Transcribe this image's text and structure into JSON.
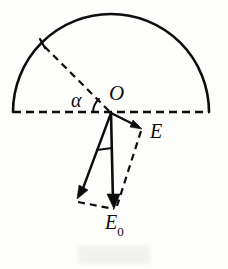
{
  "figure": {
    "kind": "vector-decomposition-diagram",
    "width": 228,
    "height": 269,
    "background_color": "#fdfdfc",
    "ink_color": "#0d0d0d"
  },
  "labels": {
    "origin": "O",
    "angle": "α",
    "field_resultant": "E",
    "field_base": "E",
    "field_base_subscript": "0"
  },
  "geometry": {
    "semicircle": {
      "center_x": 111,
      "center_y": 112,
      "radius": 98,
      "style": "solid",
      "span_degrees": 180
    },
    "diameter": {
      "from_x": 13,
      "from_y": 112,
      "to_x": 209,
      "to_y": 112,
      "style": "dashed"
    },
    "radius_line": {
      "from_x": 111,
      "from_y": 112,
      "to_x": 42,
      "to_y": 44,
      "style": "dashed"
    },
    "vector_E": {
      "from_x": 111,
      "from_y": 113,
      "to_x": 141,
      "to_y": 128,
      "style": "solid",
      "arrow": true
    },
    "vector_E0": {
      "from_x": 111,
      "from_y": 113,
      "to_x": 113,
      "to_y": 208,
      "style": "solid",
      "arrow": true
    },
    "vector_left": {
      "from_x": 111,
      "from_y": 113,
      "to_x": 78,
      "to_y": 198,
      "style": "solid",
      "arrow": true
    },
    "parallelogram_side_right": {
      "from_x": 141,
      "from_y": 130,
      "to_x": 117,
      "to_y": 207,
      "style": "dashed"
    },
    "parallelogram_side_bottom": {
      "from_x": 79,
      "from_y": 201,
      "to_x": 115,
      "to_y": 208,
      "style": "dashed"
    },
    "angle_arc_alpha": {
      "center_x": 111,
      "center_y": 112,
      "radius": 17,
      "from_degrees": 180,
      "to_degrees": 225,
      "style": "solid"
    },
    "angle_tick_lower": {
      "from_x": 97,
      "from_y": 149,
      "to_x": 112,
      "to_y": 147,
      "style": "solid"
    }
  }
}
